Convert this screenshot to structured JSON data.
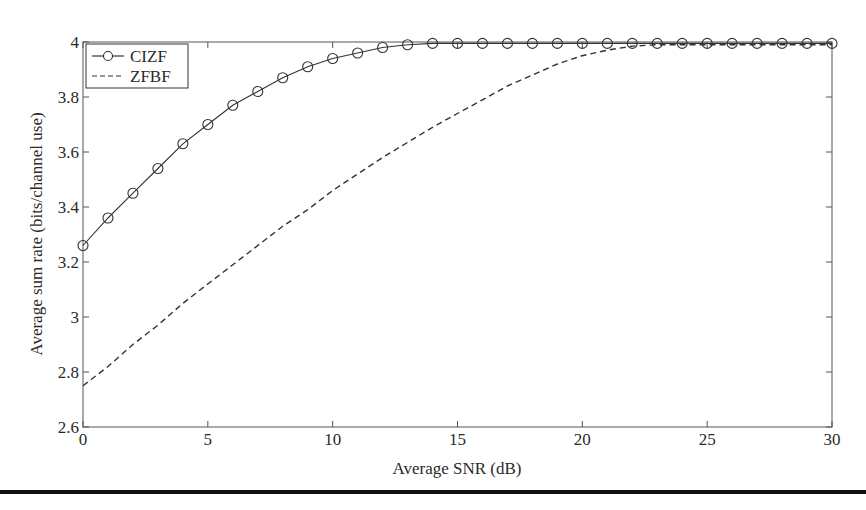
{
  "chart_data": {
    "type": "line",
    "title": "",
    "xlabel": "Average SNR (dB)",
    "ylabel": "Average sum rate (bits/channel use)",
    "xlim": [
      0,
      30
    ],
    "ylim": [
      2.6,
      4
    ],
    "xticks": [
      0,
      5,
      10,
      15,
      20,
      25,
      30
    ],
    "xtick_labels": [
      "0",
      "5",
      "10",
      "15",
      "20",
      "25",
      "30"
    ],
    "yticks": [
      2.6,
      2.8,
      3.0,
      3.2,
      3.4,
      3.6,
      3.8,
      4.0
    ],
    "ytick_labels": [
      "2.6",
      "2.8",
      "3",
      "3.2",
      "3.4",
      "3.6",
      "3.8",
      "4"
    ],
    "grid": false,
    "legend_position": "upper left",
    "x": [
      0,
      1,
      2,
      3,
      4,
      5,
      6,
      7,
      8,
      9,
      10,
      11,
      12,
      13,
      14,
      15,
      16,
      17,
      18,
      19,
      20,
      21,
      22,
      23,
      24,
      25,
      26,
      27,
      28,
      29,
      30
    ],
    "series": [
      {
        "name": "CIZF",
        "style": "solid",
        "marker": "circle",
        "color": "#333333",
        "values": [
          3.26,
          3.36,
          3.45,
          3.54,
          3.63,
          3.7,
          3.77,
          3.82,
          3.87,
          3.91,
          3.94,
          3.96,
          3.98,
          3.99,
          3.995,
          3.995,
          3.995,
          3.995,
          3.995,
          3.995,
          3.995,
          3.995,
          3.995,
          3.995,
          3.995,
          3.995,
          3.995,
          3.995,
          3.995,
          3.995,
          3.995
        ]
      },
      {
        "name": "ZFBF",
        "style": "dashed",
        "marker": "none",
        "color": "#333333",
        "values": [
          2.75,
          2.82,
          2.9,
          2.97,
          3.05,
          3.12,
          3.19,
          3.26,
          3.33,
          3.39,
          3.46,
          3.52,
          3.58,
          3.635,
          3.69,
          3.74,
          3.79,
          3.84,
          3.88,
          3.92,
          3.95,
          3.97,
          3.985,
          3.99,
          3.99,
          3.99,
          3.99,
          3.99,
          3.99,
          3.99,
          3.99
        ]
      }
    ]
  }
}
